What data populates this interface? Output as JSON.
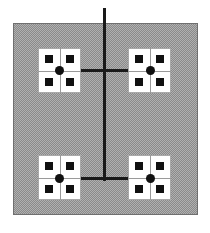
{
  "figure": {
    "type": "quadtree-decomposition-diagram",
    "width": 210,
    "height": 233,
    "background": "#ffffff",
    "colors": {
      "plate_fill": "#b0b0b0",
      "plate_dither": "#8a8a8a",
      "plate_border": "#6f6f6f",
      "cell_fill": "#ffffff",
      "cell_border": "#a9a9a9",
      "split_line": "#9a9a9a",
      "marker": "#111111",
      "edge": "#1a1a1a"
    },
    "plate": {
      "x": 13,
      "y": 23,
      "width": 185,
      "height": 192
    },
    "cells": [
      {
        "name": "top-left-cell",
        "x": 38,
        "y": 48,
        "width": 43,
        "height": 45,
        "quadrant_markers": 4
      },
      {
        "name": "top-right-cell",
        "x": 128,
        "y": 48,
        "width": 43,
        "height": 45,
        "quadrant_markers": 4
      },
      {
        "name": "bottom-left-cell",
        "x": 38,
        "y": 155,
        "width": 43,
        "height": 45,
        "quadrant_markers": 4
      },
      {
        "name": "bottom-right-cell",
        "x": 128,
        "y": 155,
        "width": 43,
        "height": 45,
        "quadrant_markers": 4
      }
    ],
    "nodes": [
      {
        "name": "top-left-node",
        "cx": 59,
        "cy": 70
      },
      {
        "name": "top-right-node",
        "cx": 150,
        "cy": 70
      },
      {
        "name": "bottom-left-node",
        "cx": 59,
        "cy": 178
      },
      {
        "name": "bottom-right-node",
        "cx": 150,
        "cy": 178
      }
    ],
    "edges": [
      {
        "name": "root-stem-vertical",
        "orientation": "vertical",
        "x": 104,
        "y1": 8,
        "y2": 181
      },
      {
        "name": "upper-horizontal-link",
        "orientation": "horizontal",
        "y": 70,
        "x1": 59,
        "x2": 150
      },
      {
        "name": "lower-horizontal-link",
        "orientation": "horizontal",
        "y": 178,
        "x1": 59,
        "x2": 150
      }
    ]
  }
}
